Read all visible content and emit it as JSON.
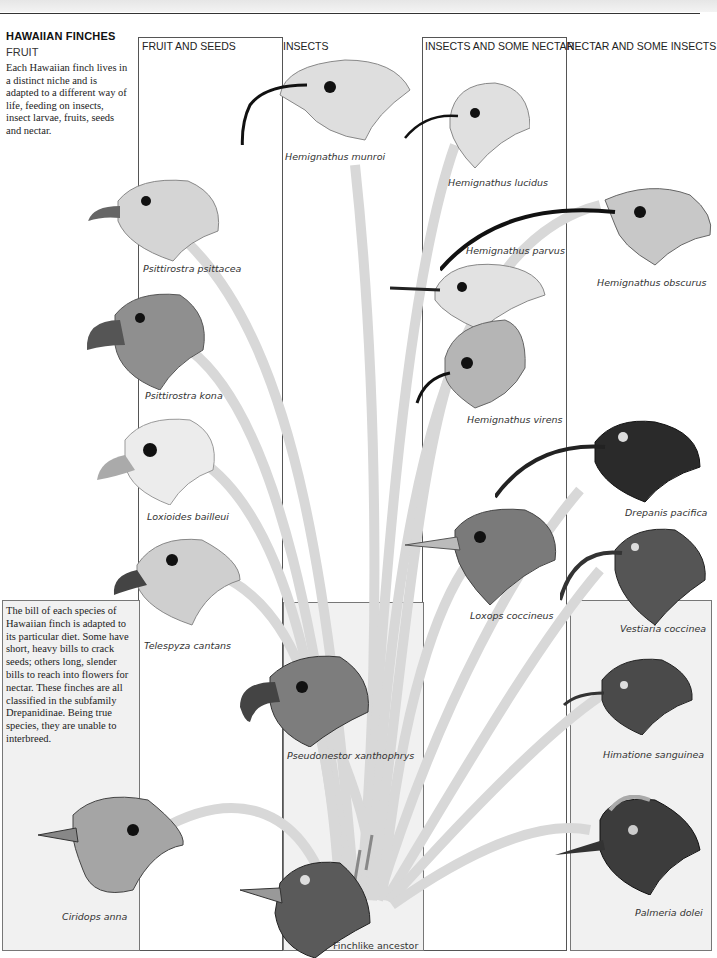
{
  "page": {
    "header_text": "",
    "title": "HAWAIIAN FINCHES",
    "subtitle": "FRUIT",
    "intro": "Each Hawaiian finch lives in a distinct niche and is adapted to a different way of life, feeding on insects, insect larvae, fruits, seeds and nectar.",
    "note": "The bill of each species of Hawaiian finch is adapted to its particular diet. Some have short, heavy bills to crack seeds; others long, slender bills to reach into flowers for nectar. These finches are all classified in the subfamily Drepanidinae. Being true species, they are unable to interbreed."
  },
  "columns": [
    {
      "label": "FRUIT AND SEEDS"
    },
    {
      "label": "INSECTS"
    },
    {
      "label": "INSECTS AND SOME NECTAR"
    },
    {
      "label": "NECTAR AND SOME INSECTS"
    }
  ],
  "species": [
    {
      "name": "Hemignathus munroi",
      "diet": "Insects",
      "shade": "light",
      "bill": "long-curved"
    },
    {
      "name": "Hemignathus lucidus",
      "diet": "Insects and some nectar",
      "shade": "light",
      "bill": "curved-split"
    },
    {
      "name": "Hemignathus obscurus",
      "diet": "Nectar and some insects",
      "shade": "speckled",
      "bill": "very-long-curved"
    },
    {
      "name": "Hemignathus parvus",
      "diet": "Insects and some nectar",
      "shade": "light",
      "bill": "slender"
    },
    {
      "name": "Psittirostra psittacea",
      "diet": "Fruit and seeds",
      "shade": "light",
      "bill": "hooked"
    },
    {
      "name": "Psittirostra kona",
      "diet": "Fruit and seeds",
      "shade": "dark",
      "bill": "heavy-hooked"
    },
    {
      "name": "Hemignathus virens",
      "diet": "Insects and some nectar",
      "shade": "medium",
      "bill": "curved"
    },
    {
      "name": "Loxioides bailleui",
      "diet": "Fruit and seeds",
      "shade": "pale",
      "bill": "finch"
    },
    {
      "name": "Drepanis pacifica",
      "diet": "Nectar and some insects",
      "shade": "black",
      "bill": "long-curved"
    },
    {
      "name": "Telespyza cantans",
      "diet": "Fruit and seeds",
      "shade": "light",
      "bill": "finch"
    },
    {
      "name": "Loxops coccineus",
      "diet": "Insects and some nectar",
      "shade": "dark",
      "bill": "short-pointed"
    },
    {
      "name": "Vestiaria coccinea",
      "diet": "Nectar and some insects",
      "shade": "dark",
      "bill": "curved"
    },
    {
      "name": "Pseudonestor xanthophrys",
      "diet": "Insects",
      "shade": "dark",
      "bill": "parrot"
    },
    {
      "name": "Himatione sanguinea",
      "diet": "Nectar and some insects",
      "shade": "dark",
      "bill": "short-curved"
    },
    {
      "name": "Ciridops anna",
      "diet": "Fruit and seeds",
      "shade": "scaled",
      "bill": "finch"
    },
    {
      "name": "Palmeria dolei",
      "diet": "Nectar and some insects",
      "shade": "crested",
      "bill": "short"
    }
  ],
  "ancestor": {
    "name": "Finchlike ancestor"
  },
  "colors": {
    "branch": "#d6d6d6",
    "frame": "#555555",
    "panel": "#f1f1f1"
  }
}
